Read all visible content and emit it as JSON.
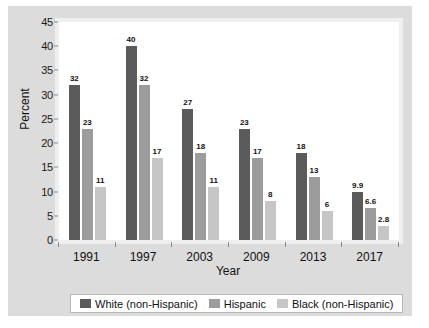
{
  "chart_data": {
    "type": "bar",
    "title": "",
    "xlabel": "Year",
    "ylabel": "Percent",
    "categories": [
      "1991",
      "1997",
      "2003",
      "2009",
      "2013",
      "2017"
    ],
    "ylim": [
      0,
      45
    ],
    "ytick_labels": [
      "0",
      "5",
      "10",
      "15",
      "20",
      "25",
      "30",
      "35",
      "40",
      "45"
    ],
    "ytick_values": [
      0,
      5,
      10,
      15,
      20,
      25,
      30,
      35,
      40,
      45
    ],
    "grid": false,
    "legend_position": "bottom",
    "series": [
      {
        "name": "White (non-Hispanic)",
        "color": "#5b5b5b",
        "values": [
          32,
          40,
          27,
          23,
          18,
          9.9
        ],
        "labels": [
          "32",
          "40",
          "27",
          "23",
          "18",
          "9.9"
        ]
      },
      {
        "name": "Hispanic",
        "color": "#9c9c9c",
        "values": [
          23,
          32,
          18,
          17,
          13,
          6.6
        ],
        "labels": [
          "23",
          "32",
          "18",
          "17",
          "13",
          "6.6"
        ]
      },
      {
        "name": "Black (non-Hispanic)",
        "color": "#c6c6c6",
        "values": [
          11,
          17,
          11,
          8,
          6,
          2.8
        ],
        "labels": [
          "11",
          "17",
          "11",
          "8",
          "6",
          "2.8"
        ]
      }
    ]
  },
  "colors": {
    "figure_background": "#dcdcdc",
    "plot_background": "#ffffff",
    "axis": "#8a8a8a",
    "text": "#111111"
  }
}
